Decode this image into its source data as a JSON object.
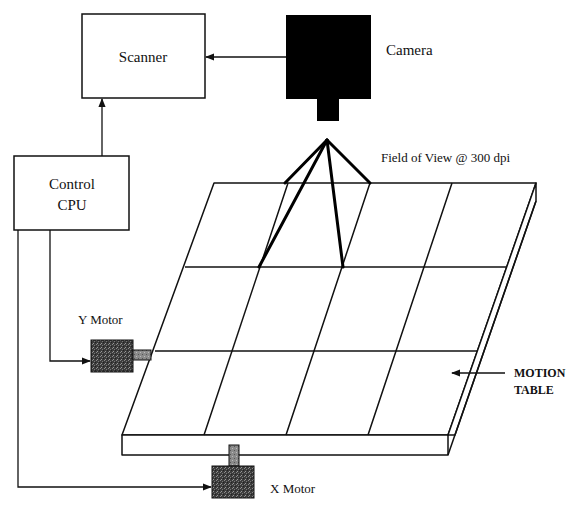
{
  "diagram": {
    "type": "system block diagram",
    "colors": {
      "line": "#111111",
      "camera_fill": "#000000",
      "motor_fill": "#3a3a3a",
      "background": "#ffffff"
    },
    "nodes": {
      "scanner": {
        "label": "Scanner"
      },
      "camera": {
        "label": "Camera"
      },
      "control_cpu": {
        "label_line1": "Control",
        "label_line2": "CPU"
      },
      "y_motor": {
        "label": "Y Motor"
      },
      "x_motor": {
        "label": "X Motor"
      },
      "motion_table": {
        "label_line1": "MOTION",
        "label_line2": "TABLE",
        "grid_rows": 3,
        "grid_cols": 4
      },
      "field_of_view": {
        "label": "Field of View @ 300 dpi"
      }
    },
    "edges": [
      {
        "from": "camera",
        "to": "scanner"
      },
      {
        "from": "control_cpu",
        "to": "scanner"
      },
      {
        "from": "control_cpu",
        "to": "y_motor"
      },
      {
        "from": "control_cpu",
        "to": "x_motor"
      },
      {
        "from": "y_motor",
        "to": "motion_table"
      },
      {
        "from": "x_motor",
        "to": "motion_table"
      },
      {
        "from": "camera",
        "to": "motion_table"
      }
    ]
  }
}
